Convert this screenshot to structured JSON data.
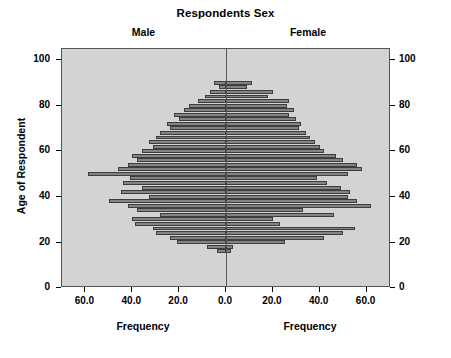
{
  "chart_data": {
    "type": "bar",
    "title": "Respondents Sex",
    "subtitle_left": "Male",
    "subtitle_right": "Female",
    "xlabel": "Frequency",
    "ylabel": "Age of Respondent",
    "orientation": "horizontal",
    "layout": "population-pyramid",
    "grid": false,
    "legend": "none",
    "plot_background": "#d3d3d3",
    "bar_fill": "#838383",
    "bar_border": "#3d3d3d",
    "ylim": [
      0,
      105
    ],
    "y_ticks": [
      0,
      20,
      40,
      60,
      80,
      100
    ],
    "xlim_left": [
      70,
      0
    ],
    "xlim_right": [
      0,
      70
    ],
    "x_ticks_left": [
      "60.0",
      "40.0",
      "20.0",
      "0.0"
    ],
    "x_ticks_right": [
      "0.0",
      "20.0",
      "40.0",
      "60.0"
    ],
    "bin_width": 2,
    "categories": [
      90,
      88,
      86,
      84,
      82,
      80,
      78,
      76,
      74,
      72,
      70,
      68,
      66,
      64,
      62,
      60,
      58,
      56,
      54,
      52,
      50,
      48,
      46,
      44,
      42,
      40,
      38,
      36,
      34,
      32,
      30,
      28,
      26,
      24,
      22,
      20,
      18,
      16
    ],
    "series": [
      {
        "name": "Male",
        "side": "left",
        "values": [
          5,
          3,
          7,
          9,
          12,
          16,
          18,
          22,
          20,
          25,
          24,
          28,
          30,
          33,
          31,
          36,
          40,
          38,
          42,
          46,
          59,
          41,
          44,
          36,
          45,
          33,
          50,
          42,
          38,
          28,
          40,
          39,
          31,
          30,
          24,
          21,
          8,
          4
        ]
      },
      {
        "name": "Female",
        "side": "right",
        "values": [
          11,
          9,
          20,
          18,
          27,
          26,
          29,
          27,
          30,
          32,
          31,
          34,
          36,
          38,
          40,
          42,
          47,
          50,
          56,
          58,
          52,
          39,
          43,
          49,
          53,
          52,
          56,
          62,
          33,
          46,
          20,
          23,
          55,
          50,
          42,
          25,
          3,
          2
        ]
      }
    ]
  }
}
